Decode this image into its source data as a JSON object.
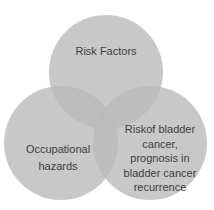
{
  "diagram": {
    "type": "venn",
    "background_color": "#ffffff",
    "circle_fill_color": "#bababa",
    "circle_fill_opacity": 0.8,
    "circle_rendered_color": "#c8c8c8",
    "overlap_rendered_color": "#bdbdbd",
    "text_color": "#3e3e3e",
    "circles": [
      {
        "id": "risk-factors",
        "label": "Risk Factors",
        "lines": [
          "Risk Factors"
        ]
      },
      {
        "id": "occupational-hazards",
        "label": "Occupational hazards",
        "lines": [
          "Occupational",
          "hazards"
        ]
      },
      {
        "id": "bladder-cancer-risk",
        "label": "Riskof bladder cancer, prognosis in bladder cancer recurrence",
        "lines": [
          "Riskof bladder",
          "cancer,",
          "prognosis in",
          "bladder cancer",
          "recurrence"
        ]
      }
    ]
  }
}
